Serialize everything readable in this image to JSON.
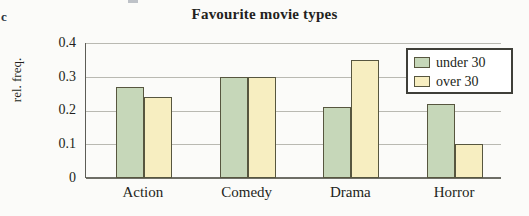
{
  "item_letter": "c",
  "chart_data": {
    "type": "bar",
    "title": "Favourite movie types",
    "xlabel": "",
    "ylabel": "rel. freq.",
    "categories": [
      "Action",
      "Comedy",
      "Drama",
      "Horror"
    ],
    "series": [
      {
        "name": "under 30",
        "values": [
          0.27,
          0.3,
          0.21,
          0.22
        ],
        "color": "#c6d7b9"
      },
      {
        "name": "over 30",
        "values": [
          0.24,
          0.3,
          0.35,
          0.1
        ],
        "color": "#f7eec1"
      }
    ],
    "ylim": [
      0,
      0.4
    ],
    "ytick_labels": [
      "0.4",
      "0.3",
      "0.2",
      "0.1",
      "0"
    ],
    "ytick_values": [
      0.4,
      0.3,
      0.2,
      0.1,
      0
    ],
    "grid": true,
    "legend_position": "top-right",
    "bar_border_color": "#57563f",
    "grid_color": "#b9b9b2",
    "axis_color": "#5d5d57"
  }
}
